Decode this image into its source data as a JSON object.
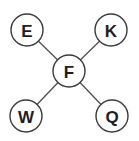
{
  "diagram": {
    "type": "star-graph",
    "center": {
      "id": "F",
      "label": "F",
      "cx": 69,
      "cy": 71,
      "r": 16
    },
    "nodes": [
      {
        "id": "E",
        "label": "E",
        "cx": 27,
        "cy": 30,
        "r": 16
      },
      {
        "id": "K",
        "label": "K",
        "cx": 111,
        "cy": 30,
        "r": 16
      },
      {
        "id": "W",
        "label": "W",
        "cx": 26,
        "cy": 116,
        "r": 16
      },
      {
        "id": "Q",
        "label": "Q",
        "cx": 112,
        "cy": 116,
        "r": 16
      }
    ],
    "edges": [
      {
        "from": "F",
        "to": "E"
      },
      {
        "from": "F",
        "to": "K"
      },
      {
        "from": "F",
        "to": "W"
      },
      {
        "from": "F",
        "to": "Q"
      }
    ],
    "colors": {
      "background": "#ffffff",
      "stroke": "#3a3a3a",
      "text": "#1e1e1e"
    }
  }
}
